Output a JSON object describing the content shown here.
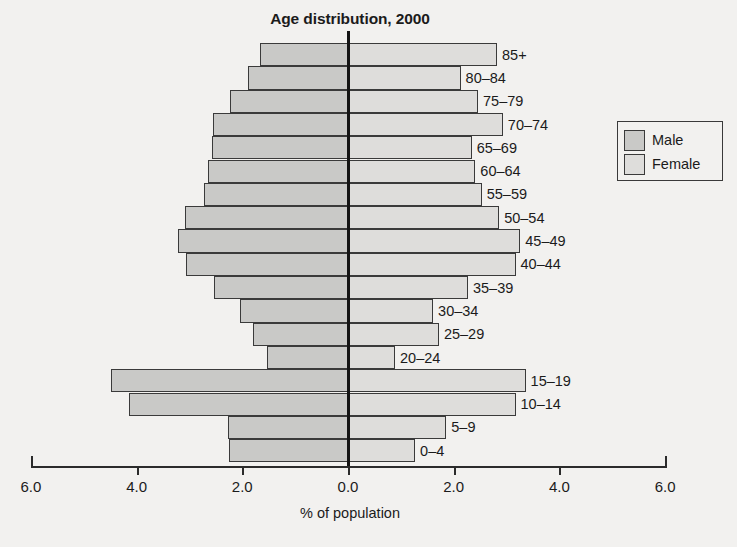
{
  "chart_data": {
    "type": "bar",
    "subtype": "population-pyramid",
    "title": "Age distribution, 2000",
    "xlabel": "% of population",
    "ylabel": "",
    "xlim": [
      -6.0,
      6.0
    ],
    "xticks": [
      6.0,
      4.0,
      2.0,
      0.0,
      2.0,
      4.0,
      6.0
    ],
    "xticklabels": [
      "6.0",
      "4.0",
      "2.0",
      "0.0",
      "2.0",
      "4.0",
      "6.0"
    ],
    "grid": false,
    "legend_position": "right",
    "categories": [
      "85+",
      "80–84",
      "75–79",
      "70–74",
      "65–69",
      "60–64",
      "55–59",
      "50–54",
      "45–49",
      "40–44",
      "35–39",
      "30–34",
      "25–29",
      "20–24",
      "15–19",
      "10–14",
      "5–9",
      "0–4"
    ],
    "series": [
      {
        "name": "Male",
        "color": "#c9c9c7",
        "side": "left",
        "values": [
          1.67,
          1.89,
          2.23,
          2.56,
          2.57,
          2.65,
          2.72,
          3.09,
          3.22,
          3.07,
          2.54,
          2.05,
          1.8,
          1.53,
          4.49,
          4.15,
          2.27,
          2.25
        ]
      },
      {
        "name": "Female",
        "color": "#dedddb",
        "side": "right",
        "values": [
          2.82,
          2.13,
          2.46,
          2.93,
          2.34,
          2.41,
          2.53,
          2.86,
          3.26,
          3.17,
          2.27,
          1.61,
          1.72,
          0.89,
          3.36,
          3.17,
          1.86,
          1.27
        ]
      }
    ]
  },
  "legend": {
    "items": [
      {
        "label": "Male",
        "color": "#c9c9c7"
      },
      {
        "label": "Female",
        "color": "#dedddb"
      }
    ]
  }
}
